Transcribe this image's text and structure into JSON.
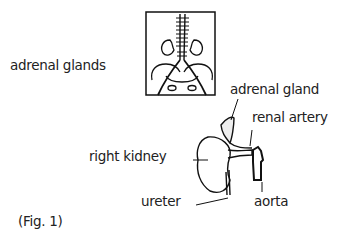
{
  "figure": {
    "caption": "(Fig. 1)",
    "title_label": "adrenal glands",
    "labels": {
      "adrenal_gland": "adrenal gland",
      "renal_artery": "renal artery",
      "right_kidney": "right kidney",
      "ureter": "ureter",
      "aorta": "aorta"
    }
  }
}
